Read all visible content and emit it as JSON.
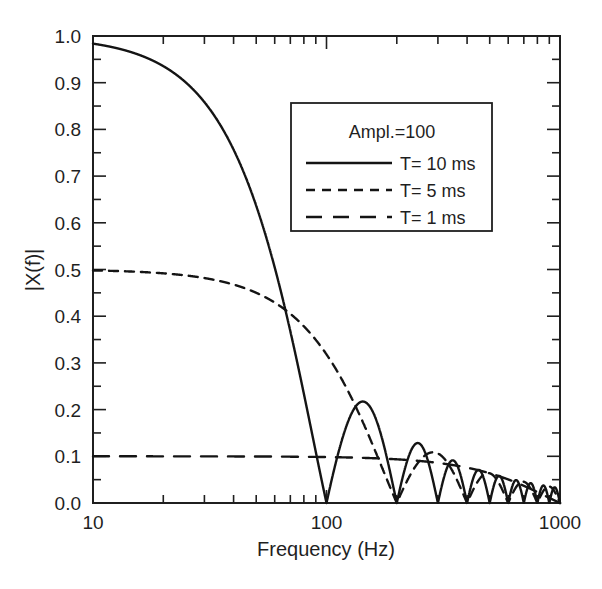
{
  "chart_data": {
    "type": "line",
    "title": "",
    "xlabel": "Frequency (Hz)",
    "ylabel": "|X(f)|",
    "xscale": "log",
    "yscale": "linear",
    "xlim": [
      10,
      1000
    ],
    "ylim": [
      0.0,
      1.0
    ],
    "grid": false,
    "x_tick_labels": [
      "10",
      "100",
      "1000"
    ],
    "x_tick_values": [
      10,
      100,
      1000
    ],
    "y_tick_labels": [
      "0.0",
      "0.1",
      "0.2",
      "0.3",
      "0.4",
      "0.5",
      "0.6",
      "0.7",
      "0.8",
      "0.9",
      "1.0"
    ],
    "y_tick_values": [
      0.0,
      0.1,
      0.2,
      0.3,
      0.4,
      0.5,
      0.6,
      0.7,
      0.8,
      0.9,
      1.0
    ],
    "y_minor_ticks": [
      0.05,
      0.15,
      0.25,
      0.35,
      0.45,
      0.55,
      0.65,
      0.75,
      0.85,
      0.95
    ],
    "annotation": "Ampl.=100",
    "legend_position": "upper center",
    "series": [
      {
        "name": "T= 10 ms",
        "style": "solid",
        "amplitude": 1.0,
        "pulse_width_ms": 10,
        "model": "abs(A*sinc(f*T))",
        "description": "Magnitude spectrum of 10 ms rectangular pulse; first null at 100 Hz",
        "nulls_hz": [
          100,
          200,
          300,
          400,
          500,
          600,
          700,
          800,
          900,
          1000
        ],
        "points": [
          {
            "f": 10,
            "y": 0.984
          },
          {
            "f": 20,
            "y": 0.935
          },
          {
            "f": 30,
            "y": 0.858
          },
          {
            "f": 40,
            "y": 0.757
          },
          {
            "f": 50,
            "y": 0.637
          },
          {
            "f": 60,
            "y": 0.505
          },
          {
            "f": 70,
            "y": 0.368
          },
          {
            "f": 80,
            "y": 0.234
          },
          {
            "f": 90,
            "y": 0.109
          },
          {
            "f": 100,
            "y": 0.0
          },
          {
            "f": 150,
            "y": 0.212
          },
          {
            "f": 200,
            "y": 0.0
          },
          {
            "f": 250,
            "y": 0.127
          },
          {
            "f": 300,
            "y": 0.0
          },
          {
            "f": 350,
            "y": 0.091
          },
          {
            "f": 400,
            "y": 0.0
          },
          {
            "f": 450,
            "y": 0.071
          },
          {
            "f": 500,
            "y": 0.0
          },
          {
            "f": 550,
            "y": 0.058
          },
          {
            "f": 600,
            "y": 0.0
          },
          {
            "f": 650,
            "y": 0.049
          },
          {
            "f": 700,
            "y": 0.0
          },
          {
            "f": 750,
            "y": 0.042
          },
          {
            "f": 800,
            "y": 0.0
          },
          {
            "f": 850,
            "y": 0.037
          },
          {
            "f": 900,
            "y": 0.0
          },
          {
            "f": 950,
            "y": 0.033
          },
          {
            "f": 1000,
            "y": 0.0
          }
        ]
      },
      {
        "name": "T=  5 ms",
        "style": "dashed",
        "amplitude": 0.5,
        "pulse_width_ms": 5,
        "model": "abs(A*sinc(f*T))",
        "description": "Magnitude spectrum of 5 ms rectangular pulse; first null at 200 Hz",
        "nulls_hz": [
          200,
          400,
          600,
          800,
          1000
        ],
        "points": [
          {
            "f": 10,
            "y": 0.5
          },
          {
            "f": 20,
            "y": 0.498
          },
          {
            "f": 40,
            "y": 0.487
          },
          {
            "f": 60,
            "y": 0.47
          },
          {
            "f": 80,
            "y": 0.447
          },
          {
            "f": 100,
            "y": 0.419
          },
          {
            "f": 120,
            "y": 0.386
          },
          {
            "f": 140,
            "y": 0.347
          },
          {
            "f": 160,
            "y": 0.303
          },
          {
            "f": 180,
            "y": 0.255
          },
          {
            "f": 200,
            "y": 0.0
          },
          {
            "f": 300,
            "y": 0.106
          },
          {
            "f": 400,
            "y": 0.0
          },
          {
            "f": 500,
            "y": 0.064
          },
          {
            "f": 600,
            "y": 0.0
          },
          {
            "f": 700,
            "y": 0.045
          },
          {
            "f": 800,
            "y": 0.0
          },
          {
            "f": 900,
            "y": 0.035
          },
          {
            "f": 1000,
            "y": 0.0
          }
        ]
      },
      {
        "name": "T=  1 ms",
        "style": "long-dashed",
        "amplitude": 0.1,
        "pulse_width_ms": 1,
        "model": "abs(A*sinc(f*T))",
        "description": "Magnitude spectrum of 1 ms rectangular pulse; essentially flat at 0.1 over 10-1000 Hz",
        "nulls_hz": [
          1000
        ],
        "points": [
          {
            "f": 10,
            "y": 0.1
          },
          {
            "f": 100,
            "y": 0.0998
          },
          {
            "f": 300,
            "y": 0.0985
          },
          {
            "f": 500,
            "y": 0.0964
          },
          {
            "f": 700,
            "y": 0.0935
          },
          {
            "f": 900,
            "y": 0.0899
          },
          {
            "f": 1000,
            "y": 0.0878
          }
        ]
      }
    ]
  },
  "legend": {
    "annotation": "Ampl.=100",
    "entries": [
      {
        "label": "T= 10 ms",
        "style": "solid"
      },
      {
        "label": "T=  5 ms",
        "style": "dashed"
      },
      {
        "label": "T=  1 ms",
        "style": "long-dashed"
      }
    ]
  },
  "axes": {
    "x_title": "Frequency (Hz)",
    "y_title": "|X(f)|"
  }
}
